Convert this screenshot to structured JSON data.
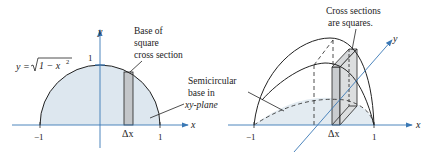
{
  "left_figure": {
    "equation": {
      "lhs": "y =",
      "radical": "1 − x",
      "exponent": "2"
    },
    "y_axis_label": "y",
    "x_axis_label": "x",
    "tick_top": "1",
    "tick_left": "−1",
    "tick_right": "1",
    "strip_label": "Δx",
    "callout_base": [
      "Base of",
      "square",
      "cross section"
    ],
    "callout_semicircle": [
      "Semicircular",
      "base in",
      "xy-plane"
    ]
  },
  "right_figure": {
    "callout": [
      "Cross sections",
      "are squares."
    ],
    "y_axis_label": "y",
    "x_axis_label": "x",
    "tick_left": "−1",
    "tick_right": "1",
    "strip_label": "Δx"
  },
  "colors": {
    "fill_region": "#dde7ef",
    "strip_fill": "#c9cccf",
    "axis": "#3a78b5",
    "line": "#222222"
  }
}
